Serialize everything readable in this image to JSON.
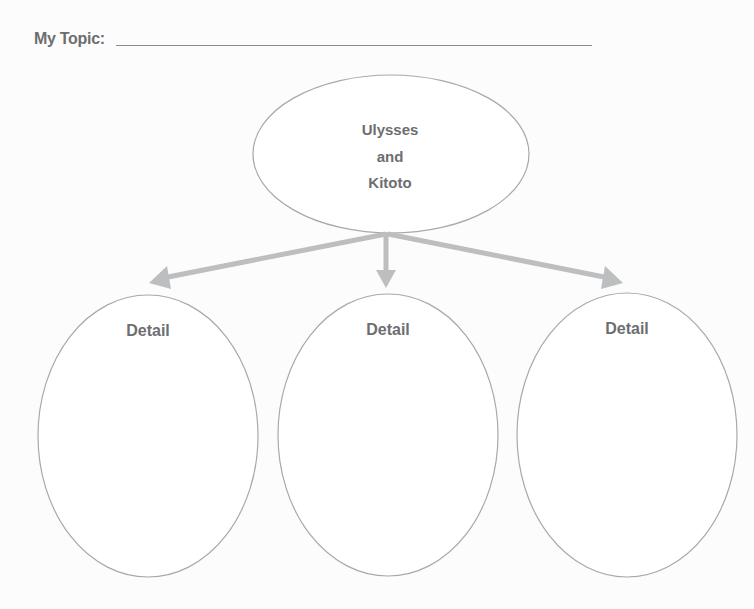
{
  "header": {
    "topic_label": "My Topic:",
    "topic_value": ""
  },
  "diagram": {
    "type": "topic-details web",
    "main_node": {
      "lines": [
        "Ulysses",
        "and",
        "Kitoto"
      ]
    },
    "detail_nodes": [
      {
        "label": "Detail"
      },
      {
        "label": "Detail"
      },
      {
        "label": "Detail"
      }
    ],
    "colors": {
      "text": "#6d6e71",
      "ellipse_stroke": "#a7a9ac",
      "arrow": "#bcbec0",
      "underline": "#8a8b8e"
    }
  }
}
